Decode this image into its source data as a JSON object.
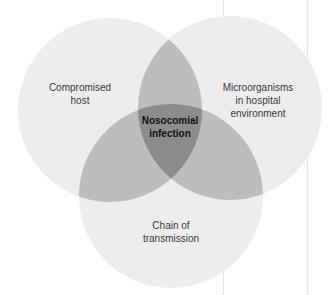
{
  "diagram": {
    "type": "venn",
    "canvas": {
      "width": 336,
      "height": 295
    },
    "colors": {
      "single": "#ededed",
      "pair": "#bdbdbd",
      "triple": "#8c8c8c",
      "text": "#3a3a3a",
      "center_text": "#111111",
      "page_line": "#e6e6e6"
    },
    "sets": [
      {
        "id": "host",
        "label": "Compromised\nhost",
        "cx": 110,
        "cy": 110,
        "r": 92,
        "label_x": 80,
        "label_y": 81
      },
      {
        "id": "micro",
        "label": "Microorganisms\nin hospital\nenvironment",
        "cx": 230,
        "cy": 108,
        "r": 92,
        "label_x": 258,
        "label_y": 81
      },
      {
        "id": "chain",
        "label": "Chain of\ntransmission",
        "cx": 171,
        "cy": 196,
        "r": 92,
        "label_x": 171,
        "label_y": 219
      }
    ],
    "intersection": {
      "label": "Nosocomial\ninfection",
      "label_x": 170,
      "label_y": 114
    },
    "page_lines_x": [
      223,
      307
    ]
  }
}
